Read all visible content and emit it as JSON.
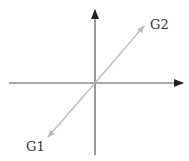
{
  "diagram": {
    "type": "vector-axes",
    "axes": {
      "horizontal": {
        "from": [
          9,
          83
        ],
        "to": [
          183,
          83
        ],
        "arrow": "end",
        "color": "#555555"
      },
      "vertical": {
        "from": [
          95,
          155
        ],
        "to": [
          95,
          10
        ],
        "arrow": "end",
        "color": "#555555"
      }
    },
    "vectors": [
      {
        "label": "G1",
        "from": [
          95,
          83
        ],
        "to": [
          48,
          137
        ],
        "color": "#bbbbbb",
        "label_pos": [
          26,
          151
        ]
      },
      {
        "label": "G2",
        "from": [
          95,
          83
        ],
        "to": [
          144,
          26
        ],
        "color": "#bbbbbb",
        "label_pos": [
          150,
          29
        ]
      }
    ]
  },
  "labels": {
    "g1": "G1",
    "g2": "G2"
  }
}
